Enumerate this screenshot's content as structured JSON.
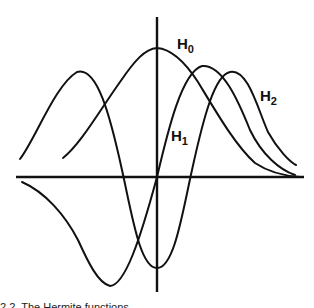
{
  "figure": {
    "labels": {
      "h0": {
        "main": "H",
        "sub": "0"
      },
      "h1": {
        "main": "H",
        "sub": "1"
      },
      "h2": {
        "main": "H",
        "sub": "2"
      }
    },
    "caption": "2.2. The Hermite functions..."
  },
  "colors": {
    "ink": "#111111",
    "background": "#ffffff"
  }
}
